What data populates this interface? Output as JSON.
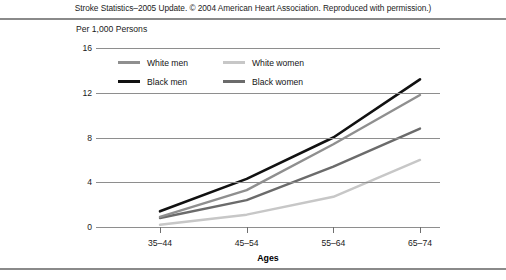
{
  "caption": "Stroke Statistics–2005 Update. © 2004 American Heart Association. Reproduced with permission.)",
  "axis_unit_title": "Per 1,000 Persons",
  "legend": {
    "items": [
      {
        "label": "White men",
        "color": "#8f8f8f"
      },
      {
        "label": "White women",
        "color": "#c7c7c7"
      },
      {
        "label": "Black men",
        "color": "#111111"
      },
      {
        "label": "Black women",
        "color": "#6b6b6b"
      }
    ]
  },
  "chart_data": {
    "type": "line",
    "title": "",
    "subtitle": "",
    "xlabel": "Ages",
    "ylabel": "Per 1,000 Persons",
    "categories": [
      "35–44",
      "45–54",
      "55–64",
      "65–74"
    ],
    "yticks": [
      0,
      4,
      8,
      12,
      16
    ],
    "ylim": [
      0,
      16
    ],
    "grid": true,
    "legend_position": "top-left-inside",
    "series": [
      {
        "name": "Black men",
        "color": "#111111",
        "width": 2.6,
        "values": [
          1.4,
          4.3,
          8.0,
          13.2
        ]
      },
      {
        "name": "White men",
        "color": "#8f8f8f",
        "width": 2.4,
        "values": [
          0.9,
          3.3,
          7.4,
          11.8
        ]
      },
      {
        "name": "Black women",
        "color": "#6b6b6b",
        "width": 2.4,
        "values": [
          0.8,
          2.4,
          5.4,
          8.8
        ]
      },
      {
        "name": "White women",
        "color": "#c7c7c7",
        "width": 2.4,
        "values": [
          0.2,
          1.1,
          2.7,
          6.0
        ]
      }
    ]
  }
}
